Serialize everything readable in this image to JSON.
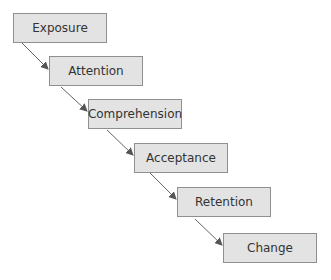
{
  "diagram": {
    "type": "flowchart-cascade",
    "steps": [
      {
        "label": "Exposure"
      },
      {
        "label": "Attention"
      },
      {
        "label": "Comprehension"
      },
      {
        "label": "Acceptance"
      },
      {
        "label": "Retention"
      },
      {
        "label": "Change"
      }
    ],
    "colors": {
      "box_fill": "#e3e3e3",
      "box_border": "#8f8f8f",
      "arrow": "#555555"
    }
  }
}
